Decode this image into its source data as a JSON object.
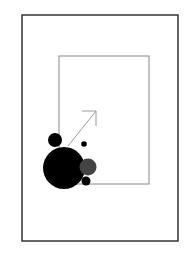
{
  "diagram": {
    "background": "#ffffff",
    "outer_frame": {
      "x": 22,
      "y": 15,
      "width": 156,
      "height": 226,
      "stroke": "#333333",
      "stroke_width": 1.5
    },
    "inner_frame": {
      "x": 59,
      "y": 56,
      "width": 90,
      "height": 128,
      "stroke": "#888888",
      "stroke_width": 1
    },
    "arrow": {
      "x1": 68,
      "y1": 146,
      "x2": 96,
      "y2": 111,
      "stroke": "#9a9a9a",
      "stroke_width": 1
    },
    "circles": [
      {
        "name": "large-black-circle",
        "cx": 64,
        "cy": 168,
        "r": 21,
        "fill": "#000000"
      },
      {
        "name": "small-top-circle",
        "cx": 55,
        "cy": 140,
        "r": 7,
        "fill": "#000000"
      },
      {
        "name": "tiny-dot-circle",
        "cx": 84,
        "cy": 144,
        "r": 2.8,
        "fill": "#000000"
      },
      {
        "name": "gray-circle",
        "cx": 88,
        "cy": 167,
        "r": 8.5,
        "fill": "#444444"
      },
      {
        "name": "small-bottom-circle",
        "cx": 86,
        "cy": 181,
        "r": 4.5,
        "fill": "#000000"
      }
    ]
  }
}
